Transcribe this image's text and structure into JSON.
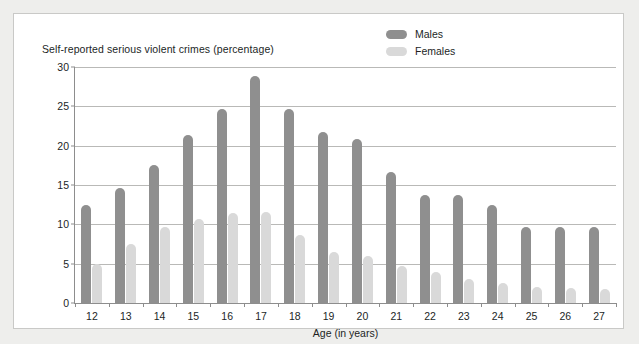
{
  "chart_data": {
    "type": "bar",
    "title": "Self-reported serious violent crimes (percentage)",
    "xlabel": "Age (in years)",
    "ylabel": "",
    "categories": [
      "12",
      "13",
      "14",
      "15",
      "16",
      "17",
      "18",
      "19",
      "20",
      "21",
      "22",
      "23",
      "24",
      "25",
      "26",
      "27"
    ],
    "series": [
      {
        "name": "Males",
        "color": "#8f8f8f",
        "values": [
          12.5,
          14.6,
          17.6,
          21.4,
          24.6,
          28.9,
          24.7,
          21.7,
          20.8,
          16.7,
          13.7,
          13.7,
          12.5,
          9.7,
          9.7,
          9.7
        ]
      },
      {
        "name": "Females",
        "color": "#d9d9d9",
        "values": [
          5.0,
          7.5,
          9.6,
          10.7,
          11.4,
          11.6,
          8.7,
          6.5,
          6.0,
          4.7,
          4.0,
          3.0,
          2.6,
          2.0,
          1.9,
          1.8
        ]
      }
    ],
    "yticks": [
      0,
      5,
      10,
      15,
      20,
      25,
      30
    ],
    "ylim": [
      0,
      30
    ],
    "grid": true,
    "legend_position": "top-right"
  },
  "legend": {
    "items": [
      {
        "label": "Males"
      },
      {
        "label": "Females"
      }
    ]
  },
  "colors": {
    "male_bar": "#8f8f8f",
    "female_bar": "#d9d9d9",
    "gridline": "#b9b9b7",
    "axis": "#8d8d8d",
    "page_background": "#eeeeec",
    "plot_background": "#ffffff",
    "text": "#221f1f"
  }
}
